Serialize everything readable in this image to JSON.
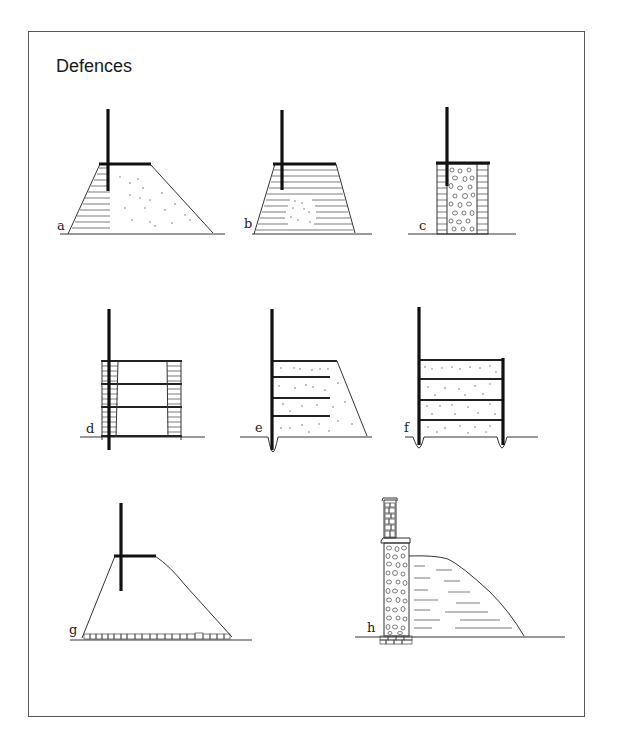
{
  "title": "Defences",
  "figures": [
    {
      "id": "a",
      "label": "a",
      "description": "Earth bank with turf/timber-laced front, palisade and walkway on top"
    },
    {
      "id": "b",
      "label": "b",
      "description": "Turf-built rampart with small earth core, palisade and walkway"
    },
    {
      "id": "c",
      "label": "c",
      "description": "Box rampart with rubble core between revetted faces, palisade and walkway"
    },
    {
      "id": "d",
      "label": "d",
      "description": "Timber-framed box rampart with horizontal tie beams and post"
    },
    {
      "id": "e",
      "label": "e",
      "description": "Front post in slot with horizontal timber lacing through earth bank"
    },
    {
      "id": "f",
      "label": "f",
      "description": "Double-post box rampart with earth infill and horizontal timbers"
    },
    {
      "id": "g",
      "label": "g",
      "description": "Earth bank on stone foundation with palisade and walkway"
    },
    {
      "id": "h",
      "label": "h",
      "description": "Stone wall with rubble core and parapet, earth bank behind, on footing"
    }
  ],
  "colors": {
    "ink": "#111111",
    "frame": "#555555",
    "background": "#ffffff"
  }
}
